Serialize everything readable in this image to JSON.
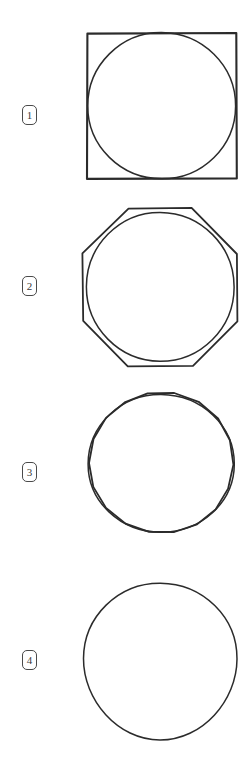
{
  "page": {
    "background_color": "#ffffff",
    "ink_color": "#2b2b2b",
    "label_color": "#3b3b3b",
    "width": 248,
    "height": 772
  },
  "figures": [
    {
      "label": "1",
      "label_box_x": 22,
      "label_box_y": 105,
      "shape": "circle-inscribed-in-square",
      "outer_polygon_sides": 4,
      "circle": {
        "cx": 161,
        "cy": 106,
        "r": 74
      },
      "square": {
        "x": 87,
        "y": 33,
        "width": 149,
        "height": 145
      },
      "stroke_width": 2.0
    },
    {
      "label": "2",
      "label_box_x": 22,
      "label_box_y": 276,
      "shape": "circle-inscribed-in-octagon",
      "outer_polygon_sides": 8,
      "circle": {
        "cx": 161,
        "cy": 287,
        "r": 74
      },
      "polygon": {
        "cx": 161,
        "cy": 287,
        "r": 80,
        "rotation_deg": 22.5
      },
      "stroke_width": 1.7
    },
    {
      "label": "3",
      "label_box_x": 22,
      "label_box_y": 462,
      "shape": "circle-inscribed-in-hexadecagon",
      "outer_polygon_sides": 18,
      "circle": {
        "cx": 161,
        "cy": 468,
        "r": 75
      },
      "polygon": {
        "cx": 161,
        "cy": 468,
        "r": 77,
        "rotation_deg": 10
      },
      "stroke_width": 1.7
    },
    {
      "label": "4",
      "label_box_x": 22,
      "label_box_y": 650,
      "shape": "circle",
      "outer_polygon_sides": 0,
      "circle": {
        "cx": 160,
        "cy": 660,
        "r": 77
      },
      "stroke_width": 1.4
    }
  ]
}
